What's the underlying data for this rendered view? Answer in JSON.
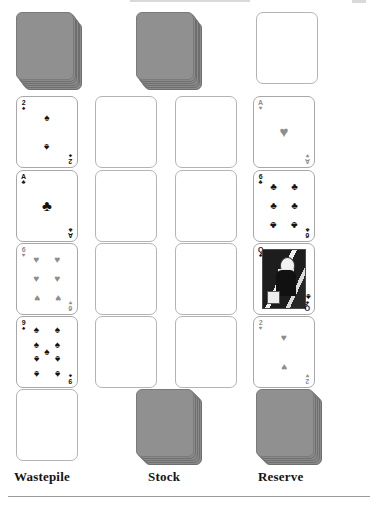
{
  "layout": {
    "columns_x": [
      16,
      95,
      175,
      253
    ],
    "card_size": {
      "width": 62,
      "height": 72
    },
    "rows_y": [
      12,
      96,
      170,
      243,
      316,
      389
    ]
  },
  "labels": {
    "wastepile": "Wastepile",
    "stock": "Stock",
    "reserve": "Reserve"
  },
  "suits": {
    "spade": "♠",
    "heart": "♥",
    "club": "♣",
    "diamond": "♦"
  },
  "colors": {
    "card_back": "#8a8a8a",
    "card_back_border": "#6e6e6e",
    "card_border": "#a8a8a8",
    "empty_border": "#b4b4b4",
    "ink_black": "#121212",
    "ink_grey": "#8e8e8e",
    "rule": "#9a9a9a",
    "background": "#ffffff"
  },
  "piles": {
    "wastepile_top": {
      "type": "face-down-stack",
      "layers": 6
    },
    "stock_top": {
      "type": "face-down-stack",
      "layers": 6
    },
    "reserve_top": {
      "type": "empty"
    },
    "wastepile_bottom": {
      "type": "empty"
    },
    "stock_bottom": {
      "type": "face-down-stack",
      "layers": 5
    },
    "reserve_bottom": {
      "type": "face-down-stack",
      "layers": 5
    }
  },
  "tableau": [
    {
      "column": 1,
      "cards": [
        {
          "rank": "2",
          "suit": "spade",
          "color": "black",
          "pip_count": 2
        },
        {
          "rank": "A",
          "suit": "club",
          "color": "black",
          "pip_count": 1
        },
        {
          "rank": "6",
          "suit": "heart",
          "color": "grey",
          "pip_count": 6
        },
        {
          "rank": "9",
          "suit": "spade",
          "color": "black",
          "pip_count": 9
        }
      ]
    },
    {
      "column": 2,
      "cards": [
        {
          "rank": "",
          "suit": "",
          "color": "",
          "pip_count": 0
        },
        {
          "rank": "",
          "suit": "",
          "color": "",
          "pip_count": 0
        },
        {
          "rank": "",
          "suit": "",
          "color": "",
          "pip_count": 0
        },
        {
          "rank": "",
          "suit": "",
          "color": "",
          "pip_count": 0
        }
      ]
    },
    {
      "column": 3,
      "cards": [
        {
          "rank": "",
          "suit": "",
          "color": "",
          "pip_count": 0
        },
        {
          "rank": "",
          "suit": "",
          "color": "",
          "pip_count": 0
        },
        {
          "rank": "",
          "suit": "",
          "color": "",
          "pip_count": 0
        },
        {
          "rank": "",
          "suit": "",
          "color": "",
          "pip_count": 0
        }
      ]
    },
    {
      "column": 4,
      "cards": [
        {
          "rank": "A",
          "suit": "heart",
          "color": "grey",
          "pip_count": 1
        },
        {
          "rank": "6",
          "suit": "club",
          "color": "black",
          "pip_count": 6
        },
        {
          "rank": "Q",
          "suit": "spade",
          "color": "black",
          "pip_count": 0,
          "court": true
        },
        {
          "rank": "2",
          "suit": "heart",
          "color": "grey",
          "pip_count": 2
        }
      ]
    }
  ]
}
